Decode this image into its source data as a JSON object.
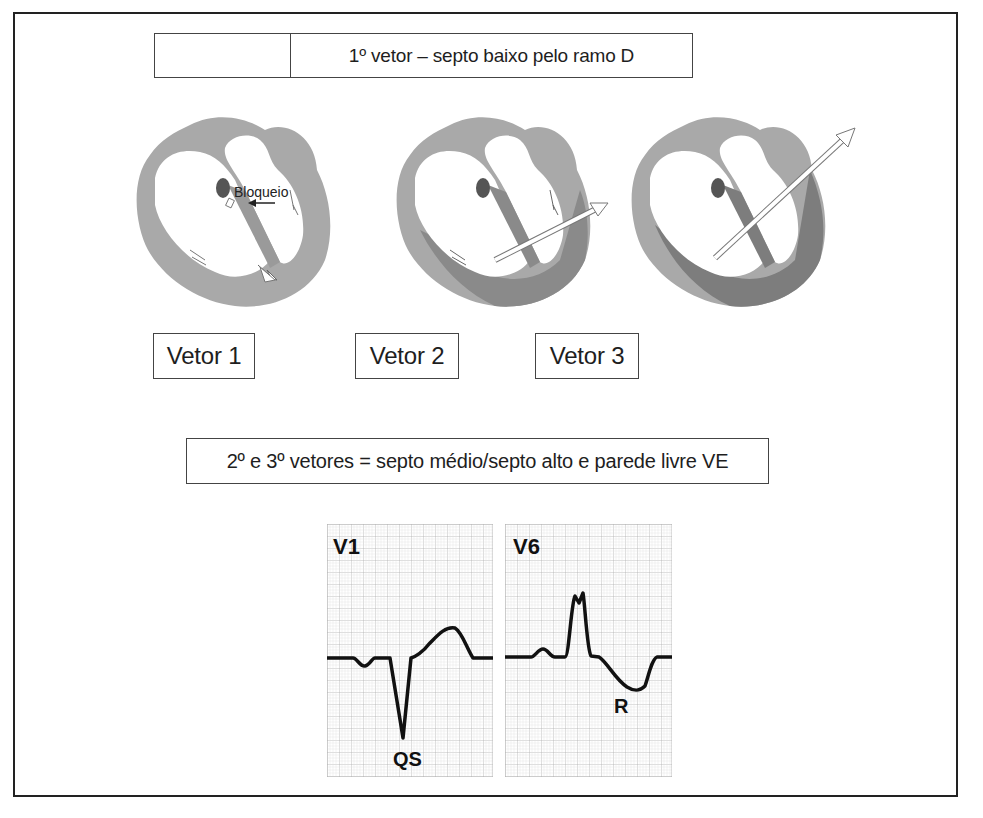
{
  "diagram": {
    "top_caption": "1º vetor – septo baixo pelo ramo D",
    "hearts": [
      {
        "id": "vetor-1",
        "annotation": "Bloqueio",
        "label": "Vetor 1"
      },
      {
        "id": "vetor-2",
        "annotation": "",
        "label": "Vetor 2"
      },
      {
        "id": "vetor-3",
        "annotation": "",
        "label": "Vetor 3"
      }
    ],
    "middle_caption": "2º e 3º vetores = septo médio/septo alto e parede livre VE",
    "ecg_leads": [
      {
        "lead": "V1",
        "wave_label": "QS"
      },
      {
        "lead": "V6",
        "wave_label": "R"
      }
    ]
  },
  "colors": {
    "myocardium_light": "#a9a9a9",
    "myocardium_dark": "#858585",
    "septum_node": "#555555",
    "grid_line": "#b5b5b5",
    "trace": "#111111",
    "frame": "#222222"
  }
}
